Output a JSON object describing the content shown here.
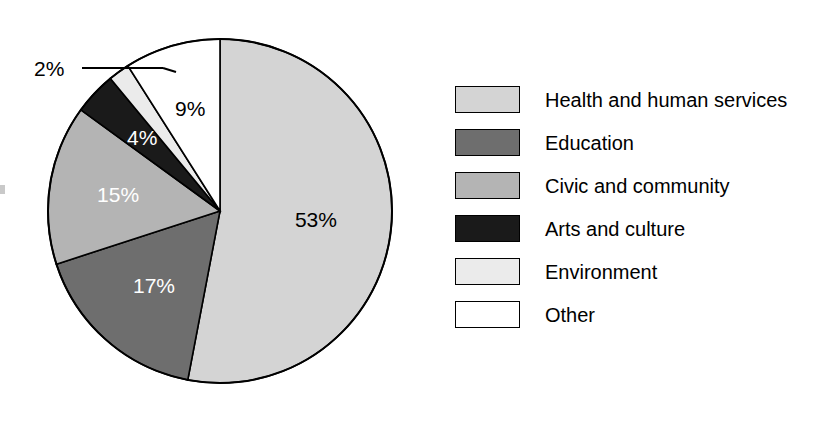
{
  "chart_data": {
    "type": "pie",
    "title": "",
    "subtitle": "",
    "xlabel": "",
    "ylabel": "",
    "units": "percent",
    "start_angle_deg": 0,
    "direction": "clockwise",
    "legend_position": "right",
    "grid": false,
    "categories": [
      "Health and human services",
      "Education",
      "Civic and community",
      "Arts and culture",
      "Environment",
      "Other"
    ],
    "values": [
      53,
      17,
      15,
      4,
      2,
      9
    ],
    "value_labels": [
      "53%",
      "17%",
      "15%",
      "4%",
      "2%",
      "9%"
    ],
    "colors": [
      "#d4d4d4",
      "#6e6e6e",
      "#b4b4b4",
      "#1a1a1a",
      "#ebebeb",
      "#ffffff"
    ],
    "slice_label_colors": [
      "#000000",
      "#ffffff",
      "#ffffff",
      "#ffffff",
      "#000000",
      "#000000"
    ],
    "slices": [
      {
        "label": "Health and human services",
        "value": 53,
        "value_label": "53%",
        "color": "#d4d4d4",
        "label_color": "#000000",
        "label_placement": "inside"
      },
      {
        "label": "Education",
        "value": 17,
        "value_label": "17%",
        "color": "#6e6e6e",
        "label_color": "#ffffff",
        "label_placement": "inside"
      },
      {
        "label": "Civic and community",
        "value": 15,
        "value_label": "15%",
        "color": "#b4b4b4",
        "label_color": "#ffffff",
        "label_placement": "inside"
      },
      {
        "label": "Arts and culture",
        "value": 4,
        "value_label": "4%",
        "color": "#1a1a1a",
        "label_color": "#ffffff",
        "label_placement": "inside"
      },
      {
        "label": "Environment",
        "value": 2,
        "value_label": "2%",
        "color": "#ebebeb",
        "label_color": "#000000",
        "label_placement": "callout-left"
      },
      {
        "label": "Other",
        "value": 9,
        "value_label": "9%",
        "color": "#ffffff",
        "label_color": "#000000",
        "label_placement": "inside"
      }
    ],
    "outline_color": "#000000",
    "background_color": "#ffffff"
  },
  "legend": {
    "items": [
      {
        "label": "Health and human services",
        "color": "#d4d4d4"
      },
      {
        "label": "Education",
        "color": "#6e6e6e"
      },
      {
        "label": "Civic and community",
        "color": "#b4b4b4"
      },
      {
        "label": "Arts and culture",
        "color": "#1a1a1a"
      },
      {
        "label": "Environment",
        "color": "#ebebeb"
      },
      {
        "label": "Other",
        "color": "#ffffff"
      }
    ]
  },
  "callouts": [
    {
      "text": "2%",
      "for": "Environment"
    }
  ]
}
